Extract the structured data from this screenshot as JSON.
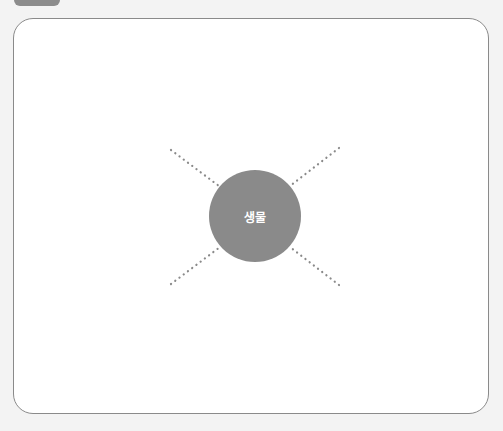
{
  "diagram": {
    "center": {
      "label": "생물",
      "color": "#8a8a8a",
      "text_color": "#ffffff",
      "cx": 255,
      "cy": 216,
      "r": 46
    },
    "connectors": [
      {
        "name": "top-left",
        "x1": 171,
        "y1": 150,
        "x2": 219,
        "y2": 186
      },
      {
        "name": "top-right",
        "x1": 339,
        "y1": 148,
        "x2": 290,
        "y2": 186
      },
      {
        "name": "bottom-left",
        "x1": 171,
        "y1": 284,
        "x2": 220,
        "y2": 247
      },
      {
        "name": "bottom-right",
        "x1": 339,
        "y1": 285,
        "x2": 290,
        "y2": 247
      }
    ],
    "connector_color": "#8a8a8a",
    "frame_border_color": "#8a8a8a",
    "background_color": "#f3f3f3"
  }
}
